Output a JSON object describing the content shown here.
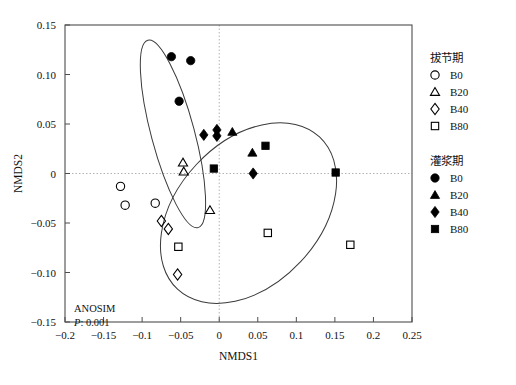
{
  "chart_data": {
    "type": "scatter",
    "title": "",
    "xlabel": "NMDS1",
    "ylabel": "NMDS2",
    "xlim": [
      -0.2,
      0.25
    ],
    "ylim": [
      -0.15,
      0.15
    ],
    "xticks": [
      "-0.2",
      "-0.15",
      "-0.1",
      "-0.05",
      "0",
      "0.05",
      "0.1",
      "0.15",
      "0.2",
      "0.25"
    ],
    "xtick_values": [
      -0.2,
      -0.15,
      -0.1,
      -0.05,
      0,
      0.05,
      0.1,
      0.15,
      0.2,
      0.25
    ],
    "yticks": [
      "0.15",
      "0.10",
      "0.05",
      "0",
      "-0.05",
      "-0.10",
      "-0.15"
    ],
    "ytick_values": [
      0.15,
      0.1,
      0.05,
      0,
      -0.05,
      -0.1,
      -0.15
    ],
    "grid": "zero-reference-dotted",
    "legend_position": "right",
    "annotation": {
      "line1": "ANOSIM",
      "line2_italic": "P",
      "line2_rest": ": 0.001"
    },
    "series": [
      {
        "name": "B0",
        "group": "拔节期",
        "marker": "circle-open",
        "points": [
          {
            "x": -0.128,
            "y": -0.013
          },
          {
            "x": -0.122,
            "y": -0.032
          },
          {
            "x": -0.083,
            "y": -0.03
          }
        ]
      },
      {
        "name": "B20",
        "group": "拔节期",
        "marker": "triangle-open",
        "points": [
          {
            "x": -0.047,
            "y": 0.011
          },
          {
            "x": -0.046,
            "y": 0.002
          },
          {
            "x": -0.012,
            "y": -0.037
          }
        ]
      },
      {
        "name": "B40",
        "group": "拔节期",
        "marker": "diamond-open",
        "points": [
          {
            "x": -0.075,
            "y": -0.048
          },
          {
            "x": -0.066,
            "y": -0.056
          },
          {
            "x": -0.054,
            "y": -0.102
          }
        ]
      },
      {
        "name": "B80",
        "group": "拔节期",
        "marker": "square-open",
        "points": [
          {
            "x": -0.053,
            "y": -0.074
          },
          {
            "x": 0.063,
            "y": -0.06
          },
          {
            "x": 0.17,
            "y": -0.072
          }
        ]
      },
      {
        "name": "B0",
        "group": "灌浆期",
        "marker": "circle-filled",
        "points": [
          {
            "x": -0.062,
            "y": 0.118
          },
          {
            "x": -0.037,
            "y": 0.114
          },
          {
            "x": -0.052,
            "y": 0.073
          }
        ]
      },
      {
        "name": "B20",
        "group": "灌浆期",
        "marker": "triangle-filled",
        "points": [
          {
            "x": 0.017,
            "y": 0.042
          },
          {
            "x": 0.043,
            "y": 0.021
          }
        ]
      },
      {
        "name": "B40",
        "group": "灌浆期",
        "marker": "diamond-filled",
        "points": [
          {
            "x": -0.02,
            "y": 0.039
          },
          {
            "x": -0.003,
            "y": 0.044
          },
          {
            "x": -0.003,
            "y": 0.038
          },
          {
            "x": 0.044,
            "y": 0.0
          }
        ]
      },
      {
        "name": "B80",
        "group": "灌浆期",
        "marker": "square-filled",
        "points": [
          {
            "x": -0.007,
            "y": 0.005
          },
          {
            "x": 0.06,
            "y": 0.028
          },
          {
            "x": 0.151,
            "y": 0.001
          }
        ]
      }
    ],
    "ellipses": [
      {
        "name": "jointing-cluster-ellipse",
        "cx": -0.06,
        "cy": 0.04,
        "rx": 0.028,
        "ry": 0.098,
        "rotation": -15
      },
      {
        "name": "filling-cluster-ellipse",
        "cx": 0.038,
        "cy": -0.04,
        "rx": 0.135,
        "ry": 0.072,
        "rotation": -47
      }
    ]
  },
  "legend": {
    "groups": [
      {
        "title": "拔节期",
        "items": [
          {
            "label": "B0",
            "marker": "circle-open"
          },
          {
            "label": "B20",
            "marker": "triangle-open"
          },
          {
            "label": "B40",
            "marker": "diamond-open"
          },
          {
            "label": "B80",
            "marker": "square-open"
          }
        ]
      },
      {
        "title": "灌浆期",
        "items": [
          {
            "label": "B0",
            "marker": "circle-filled"
          },
          {
            "label": "B20",
            "marker": "triangle-filled"
          },
          {
            "label": "B40",
            "marker": "diamond-filled"
          },
          {
            "label": "B80",
            "marker": "square-filled"
          }
        ]
      }
    ]
  },
  "colors": {
    "marker": "#000000",
    "frame": "#4d4d4d",
    "grid": "#b3b3b3",
    "background": "#ffffff"
  }
}
